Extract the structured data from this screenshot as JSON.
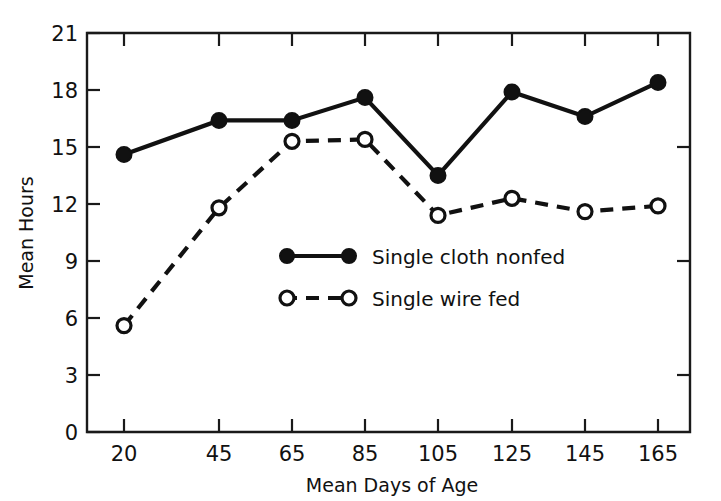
{
  "chart_data": {
    "type": "line",
    "title": "",
    "xlabel": "Mean Days of Age",
    "ylabel": "Mean Hours",
    "x": [
      20,
      45,
      65,
      85,
      105,
      125,
      145,
      165
    ],
    "xticks": [
      "20",
      "45",
      "65",
      "85",
      "105",
      "125",
      "145",
      "165"
    ],
    "yticks": [
      "0",
      "3",
      "6",
      "9",
      "12",
      "15",
      "18",
      "21"
    ],
    "xlim": [
      10,
      175
    ],
    "ylim": [
      0,
      21
    ],
    "grid": false,
    "legend_position": "center",
    "series": [
      {
        "name": "Single cloth nonfed",
        "marker": "filled-circle",
        "linestyle": "solid",
        "color": "#111111",
        "values": [
          14.6,
          16.4,
          16.4,
          17.6,
          13.5,
          17.9,
          16.6,
          18.4
        ]
      },
      {
        "name": "Single wire fed",
        "marker": "open-circle",
        "linestyle": "dashed",
        "color": "#111111",
        "values": [
          5.6,
          11.8,
          15.3,
          15.4,
          11.4,
          12.3,
          11.6,
          11.9
        ]
      }
    ]
  },
  "axes": {
    "x_title": "Mean Days of Age",
    "y_title": "Mean Hours"
  },
  "legend": {
    "entries": [
      {
        "label": "Single cloth nonfed"
      },
      {
        "label": "Single wire fed"
      }
    ]
  }
}
